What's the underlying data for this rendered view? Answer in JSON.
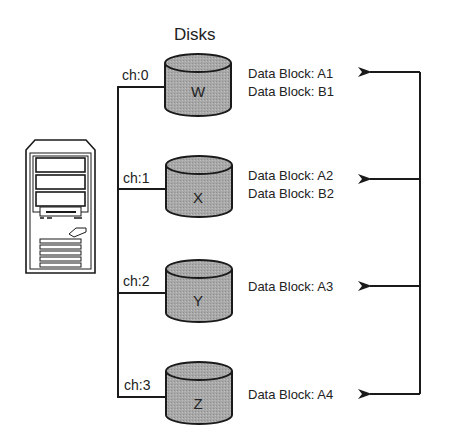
{
  "title": "Disks",
  "computer": {
    "label": "server-tower"
  },
  "disks": [
    {
      "id": "W",
      "channel": "ch:0",
      "blocks": [
        "Data Block: A1",
        "Data Block: B1"
      ]
    },
    {
      "id": "X",
      "channel": "ch:1",
      "blocks": [
        "Data Block: A2",
        "Data Block: B2"
      ]
    },
    {
      "id": "Y",
      "channel": "ch:2",
      "blocks": [
        "Data Block: A3"
      ]
    },
    {
      "id": "Z",
      "channel": "ch:3",
      "blocks": [
        "Data Block: A4"
      ]
    }
  ],
  "colors": {
    "disk_fill": "#a9a9a9",
    "disk_top": "#b8b8b8",
    "stroke": "#1a1a1a"
  }
}
